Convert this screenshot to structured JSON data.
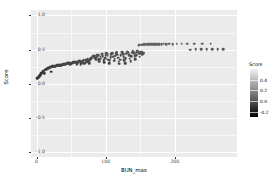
{
  "chart_data": {
    "type": "scatter",
    "title": "",
    "xlabel": "BUN_max",
    "ylabel": "Score",
    "xlim": [
      -8,
      290
    ],
    "ylim": [
      -1.08,
      1.08
    ],
    "grid": true,
    "x_ticks": [
      0,
      100,
      200
    ],
    "x_tick_labels": [
      "0",
      "100",
      "200"
    ],
    "y_ticks": [
      -1.0,
      -0.5,
      0.0,
      0.5,
      1.0
    ],
    "y_tick_labels": [
      "-1.0",
      "-0.5",
      "0.0",
      "0.5",
      "1.0"
    ],
    "legend": {
      "title": "Score",
      "position": "right",
      "type": "colorbar",
      "colormap": "grayscale-dark-low",
      "ticks": [
        0.4,
        0.2,
        0.0,
        -0.2
      ],
      "tick_labels": [
        "0.4",
        "0.2",
        "0.0",
        "-0.2"
      ],
      "range": [
        -0.3,
        0.6
      ]
    },
    "point_color_field": "Score",
    "points": [
      {
        "x": 1,
        "y": 0.075
      },
      {
        "x": 2,
        "y": 0.085
      },
      {
        "x": 3,
        "y": 0.105
      },
      {
        "x": 4,
        "y": 0.1
      },
      {
        "x": 5,
        "y": 0.12
      },
      {
        "x": 6,
        "y": 0.14
      },
      {
        "x": 7,
        "y": 0.15
      },
      {
        "x": 8,
        "y": 0.16
      },
      {
        "x": 9,
        "y": 0.175
      },
      {
        "x": 10,
        "y": 0.185
      },
      {
        "x": 11,
        "y": 0.155
      },
      {
        "x": 12,
        "y": 0.205
      },
      {
        "x": 13,
        "y": 0.2
      },
      {
        "x": 14,
        "y": 0.21
      },
      {
        "x": 15,
        "y": 0.215
      },
      {
        "x": 16,
        "y": 0.225
      },
      {
        "x": 17,
        "y": 0.222
      },
      {
        "x": 18,
        "y": 0.232
      },
      {
        "x": 19,
        "y": 0.236
      },
      {
        "x": 20,
        "y": 0.24
      },
      {
        "x": 21,
        "y": 0.175
      },
      {
        "x": 22,
        "y": 0.246
      },
      {
        "x": 23,
        "y": 0.25
      },
      {
        "x": 24,
        "y": 0.252
      },
      {
        "x": 25,
        "y": 0.248
      },
      {
        "x": 26,
        "y": 0.255
      },
      {
        "x": 27,
        "y": 0.258
      },
      {
        "x": 28,
        "y": 0.262
      },
      {
        "x": 29,
        "y": 0.259
      },
      {
        "x": 30,
        "y": 0.265
      },
      {
        "x": 31,
        "y": 0.268
      },
      {
        "x": 32,
        "y": 0.264
      },
      {
        "x": 33,
        "y": 0.27
      },
      {
        "x": 34,
        "y": 0.272
      },
      {
        "x": 35,
        "y": 0.276
      },
      {
        "x": 36,
        "y": 0.273
      },
      {
        "x": 37,
        "y": 0.278
      },
      {
        "x": 38,
        "y": 0.282
      },
      {
        "x": 39,
        "y": 0.279
      },
      {
        "x": 40,
        "y": 0.285
      },
      {
        "x": 41,
        "y": 0.288
      },
      {
        "x": 42,
        "y": 0.286
      },
      {
        "x": 43,
        "y": 0.292
      },
      {
        "x": 44,
        "y": 0.296
      },
      {
        "x": 45,
        "y": 0.3
      },
      {
        "x": 46,
        "y": 0.298
      },
      {
        "x": 47,
        "y": 0.304
      },
      {
        "x": 48,
        "y": 0.295
      },
      {
        "x": 49,
        "y": 0.285
      },
      {
        "x": 50,
        "y": 0.29
      },
      {
        "x": 51,
        "y": 0.298
      },
      {
        "x": 52,
        "y": 0.305
      },
      {
        "x": 53,
        "y": 0.31
      },
      {
        "x": 54,
        "y": 0.308
      },
      {
        "x": 55,
        "y": 0.314
      },
      {
        "x": 56,
        "y": 0.318
      },
      {
        "x": 57,
        "y": 0.312
      },
      {
        "x": 58,
        "y": 0.276
      },
      {
        "x": 59,
        "y": 0.3
      },
      {
        "x": 60,
        "y": 0.322
      },
      {
        "x": 61,
        "y": 0.33
      },
      {
        "x": 62,
        "y": 0.326
      },
      {
        "x": 63,
        "y": 0.334
      },
      {
        "x": 64,
        "y": 0.282
      },
      {
        "x": 65,
        "y": 0.3
      },
      {
        "x": 66,
        "y": 0.316
      },
      {
        "x": 67,
        "y": 0.336
      },
      {
        "x": 68,
        "y": 0.342
      },
      {
        "x": 69,
        "y": 0.29
      },
      {
        "x": 70,
        "y": 0.305
      },
      {
        "x": 71,
        "y": 0.346
      },
      {
        "x": 72,
        "y": 0.352
      },
      {
        "x": 73,
        "y": 0.318
      },
      {
        "x": 74,
        "y": 0.356
      },
      {
        "x": 75,
        "y": 0.33
      },
      {
        "x": 76,
        "y": 0.3
      },
      {
        "x": 77,
        "y": 0.344
      },
      {
        "x": 78,
        "y": 0.36
      },
      {
        "x": 79,
        "y": 0.372
      },
      {
        "x": 80,
        "y": 0.378
      },
      {
        "x": 81,
        "y": 0.392
      },
      {
        "x": 82,
        "y": 0.4
      },
      {
        "x": 83,
        "y": 0.406
      },
      {
        "x": 84,
        "y": 0.398
      },
      {
        "x": 85,
        "y": 0.37
      },
      {
        "x": 86,
        "y": 0.352
      },
      {
        "x": 87,
        "y": 0.384
      },
      {
        "x": 88,
        "y": 0.42
      },
      {
        "x": 89,
        "y": 0.412
      },
      {
        "x": 90,
        "y": 0.356
      },
      {
        "x": 91,
        "y": 0.33
      },
      {
        "x": 92,
        "y": 0.366
      },
      {
        "x": 93,
        "y": 0.396
      },
      {
        "x": 94,
        "y": 0.43
      },
      {
        "x": 95,
        "y": 0.436
      },
      {
        "x": 96,
        "y": 0.402
      },
      {
        "x": 97,
        "y": 0.34
      },
      {
        "x": 98,
        "y": 0.31
      },
      {
        "x": 99,
        "y": 0.372
      },
      {
        "x": 100,
        "y": 0.418
      },
      {
        "x": 101,
        "y": 0.446
      },
      {
        "x": 102,
        "y": 0.44
      },
      {
        "x": 103,
        "y": 0.408
      },
      {
        "x": 104,
        "y": 0.352
      },
      {
        "x": 105,
        "y": 0.296
      },
      {
        "x": 106,
        "y": 0.344
      },
      {
        "x": 107,
        "y": 0.386
      },
      {
        "x": 108,
        "y": 0.428
      },
      {
        "x": 109,
        "y": 0.452
      },
      {
        "x": 110,
        "y": 0.444
      },
      {
        "x": 111,
        "y": 0.396
      },
      {
        "x": 112,
        "y": 0.336
      },
      {
        "x": 113,
        "y": 0.362
      },
      {
        "x": 114,
        "y": 0.41
      },
      {
        "x": 115,
        "y": 0.448
      },
      {
        "x": 116,
        "y": 0.456
      },
      {
        "x": 117,
        "y": 0.424
      },
      {
        "x": 118,
        "y": 0.38
      },
      {
        "x": 119,
        "y": 0.318
      },
      {
        "x": 120,
        "y": 0.288
      },
      {
        "x": 121,
        "y": 0.352
      },
      {
        "x": 122,
        "y": 0.414
      },
      {
        "x": 123,
        "y": 0.458
      },
      {
        "x": 124,
        "y": 0.462
      },
      {
        "x": 125,
        "y": 0.432
      },
      {
        "x": 126,
        "y": 0.388
      },
      {
        "x": 127,
        "y": 0.34
      },
      {
        "x": 128,
        "y": 0.3
      },
      {
        "x": 129,
        "y": 0.374
      },
      {
        "x": 130,
        "y": 0.436
      },
      {
        "x": 131,
        "y": 0.466
      },
      {
        "x": 132,
        "y": 0.47
      },
      {
        "x": 133,
        "y": 0.45
      },
      {
        "x": 134,
        "y": 0.412
      },
      {
        "x": 135,
        "y": 0.366
      },
      {
        "x": 136,
        "y": 0.33
      },
      {
        "x": 137,
        "y": 0.398
      },
      {
        "x": 138,
        "y": 0.452
      },
      {
        "x": 139,
        "y": 0.472
      },
      {
        "x": 140,
        "y": 0.468
      },
      {
        "x": 141,
        "y": 0.442
      },
      {
        "x": 142,
        "y": 0.404
      },
      {
        "x": 143,
        "y": 0.358
      },
      {
        "x": 144,
        "y": 0.42
      },
      {
        "x": 145,
        "y": 0.46
      },
      {
        "x": 146,
        "y": 0.474
      },
      {
        "x": 147,
        "y": 0.466
      },
      {
        "x": 148,
        "y": 0.436
      },
      {
        "x": 149,
        "y": 0.396
      },
      {
        "x": 150,
        "y": 0.448
      },
      {
        "x": 151,
        "y": 0.47
      },
      {
        "x": 152,
        "y": 0.462
      },
      {
        "x": 153,
        "y": 0.43
      },
      {
        "x": 154,
        "y": 0.455
      },
      {
        "x": 155,
        "y": 0.446
      },
      {
        "x": 148,
        "y": 0.566
      },
      {
        "x": 150,
        "y": 0.57
      },
      {
        "x": 152,
        "y": 0.572
      },
      {
        "x": 154,
        "y": 0.57
      },
      {
        "x": 156,
        "y": 0.574
      },
      {
        "x": 158,
        "y": 0.572
      },
      {
        "x": 160,
        "y": 0.576
      },
      {
        "x": 162,
        "y": 0.574
      },
      {
        "x": 164,
        "y": 0.576
      },
      {
        "x": 166,
        "y": 0.578
      },
      {
        "x": 168,
        "y": 0.576
      },
      {
        "x": 170,
        "y": 0.578
      },
      {
        "x": 172,
        "y": 0.58
      },
      {
        "x": 174,
        "y": 0.578
      },
      {
        "x": 176,
        "y": 0.58
      },
      {
        "x": 178,
        "y": 0.578
      },
      {
        "x": 181,
        "y": 0.58
      },
      {
        "x": 184,
        "y": 0.582
      },
      {
        "x": 188,
        "y": 0.58
      },
      {
        "x": 192,
        "y": 0.582
      },
      {
        "x": 197,
        "y": 0.58
      },
      {
        "x": 203,
        "y": 0.584
      },
      {
        "x": 210,
        "y": 0.582
      },
      {
        "x": 218,
        "y": 0.584
      },
      {
        "x": 228,
        "y": 0.582
      },
      {
        "x": 240,
        "y": 0.584
      },
      {
        "x": 252,
        "y": 0.582
      },
      {
        "x": 222,
        "y": 0.498
      },
      {
        "x": 230,
        "y": 0.5
      },
      {
        "x": 238,
        "y": 0.5
      },
      {
        "x": 246,
        "y": 0.502
      },
      {
        "x": 254,
        "y": 0.5
      },
      {
        "x": 262,
        "y": 0.502
      },
      {
        "x": 270,
        "y": 0.5
      }
    ]
  }
}
